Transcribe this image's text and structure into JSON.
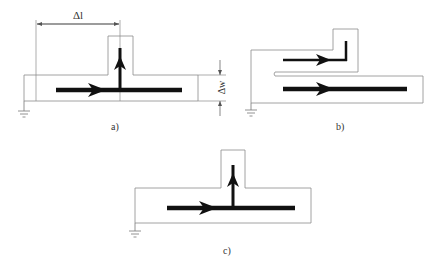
{
  "figure": {
    "panels": [
      {
        "id": "a",
        "label": "a)",
        "dimensions": {
          "length_label": "Δl",
          "width_label": "Δw"
        },
        "traces": [
          {
            "direction": "right",
            "orientation": "horizontal"
          },
          {
            "direction": "up",
            "orientation": "vertical"
          }
        ],
        "ground": true
      },
      {
        "id": "b",
        "label": "b)",
        "traces": [
          {
            "direction": "right",
            "orientation": "horizontal",
            "bends_up": true
          },
          {
            "direction": "right",
            "orientation": "horizontal"
          }
        ],
        "ground": true
      },
      {
        "id": "c",
        "label": "c)",
        "traces": [
          {
            "direction": "right",
            "orientation": "horizontal"
          },
          {
            "direction": "up",
            "orientation": "vertical"
          }
        ],
        "ground": true
      }
    ],
    "colors": {
      "outline": "#8a8a8a",
      "trace": "#111111",
      "text": "#333333"
    }
  }
}
